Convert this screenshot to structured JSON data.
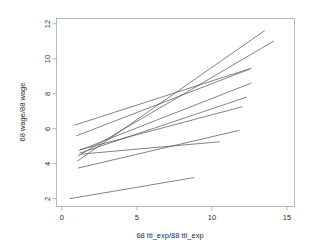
{
  "chart_data": {
    "type": "line",
    "title": "",
    "subtitle": "",
    "xlabel": "68 ttl_exp/88 ttl_exp",
    "ylabel": "68 wage/88 wage",
    "xlim": [
      -0.35,
      15.5
    ],
    "ylim": [
      1.55,
      12.3
    ],
    "xticks": [
      0,
      5,
      10,
      15
    ],
    "yticks": [
      2,
      4,
      6,
      8,
      10,
      12
    ],
    "xtick_labels": [
      "0",
      "5",
      "10",
      "15"
    ],
    "ytick_labels": [
      "2",
      "4",
      "6",
      "8",
      "10",
      "12"
    ],
    "grid": false,
    "legend": "none",
    "line_color": "#5a5a5a",
    "frame_color": "#a8a8a8",
    "background": "#ffffff",
    "series": [
      {
        "name": "line-1",
        "x": [
          1.05,
          13.5
        ],
        "y": [
          4.15,
          11.6
        ]
      },
      {
        "name": "line-2",
        "x": [
          1.1,
          14.1
        ],
        "y": [
          4.45,
          11.0
        ]
      },
      {
        "name": "line-3",
        "x": [
          0.85,
          12.6
        ],
        "y": [
          6.2,
          9.45
        ]
      },
      {
        "name": "line-4",
        "x": [
          1.0,
          12.5
        ],
        "y": [
          5.6,
          9.4
        ]
      },
      {
        "name": "line-5",
        "x": [
          1.15,
          12.6
        ],
        "y": [
          4.75,
          8.6
        ]
      },
      {
        "name": "line-6",
        "x": [
          1.2,
          12.3
        ],
        "y": [
          4.6,
          7.8
        ]
      },
      {
        "name": "line-7",
        "x": [
          1.25,
          12.0
        ],
        "y": [
          4.8,
          7.25
        ]
      },
      {
        "name": "line-8",
        "x": [
          1.1,
          11.8
        ],
        "y": [
          3.75,
          5.9
        ]
      },
      {
        "name": "line-9",
        "x": [
          1.35,
          10.5
        ],
        "y": [
          4.55,
          5.25
        ]
      },
      {
        "name": "line-10",
        "x": [
          0.55,
          8.8
        ],
        "y": [
          2.0,
          3.2
        ]
      }
    ]
  }
}
